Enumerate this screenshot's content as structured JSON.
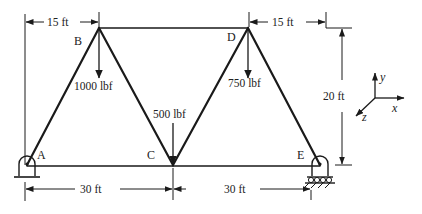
{
  "diagram": {
    "type": "plane truss",
    "nodes": [
      {
        "id": "A",
        "label": "A",
        "support": "pin"
      },
      {
        "id": "B",
        "label": "B"
      },
      {
        "id": "C",
        "label": "C"
      },
      {
        "id": "D",
        "label": "D"
      },
      {
        "id": "E",
        "label": "E",
        "support": "roller"
      }
    ],
    "members": [
      "AB",
      "BC",
      "CD",
      "DE",
      "BD",
      "AC",
      "CE"
    ],
    "loads": [
      {
        "node": "B",
        "label": "1000 lbf",
        "direction": "down"
      },
      {
        "node": "C",
        "label": "500 lbf",
        "direction": "down"
      },
      {
        "node": "D",
        "label": "750 lbf",
        "direction": "down"
      }
    ],
    "dimensions": {
      "top_left": "15 ft",
      "top_right": "15 ft",
      "height": "20 ft",
      "bottom_left": "30 ft",
      "bottom_right": "30 ft"
    },
    "axes": {
      "x": "x",
      "y": "y",
      "z": "z"
    }
  }
}
